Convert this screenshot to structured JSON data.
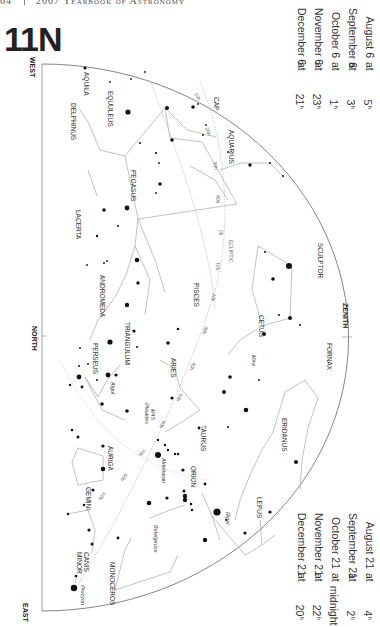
{
  "header": {
    "page_number": "64",
    "book_title": "2007 Yearbook of Astronomy"
  },
  "chart_id": "11N",
  "times_top": [
    {
      "date": "August 6",
      "time": "5",
      "unit": "h"
    },
    {
      "date": "September 6",
      "time": "3",
      "unit": "h"
    },
    {
      "date": "October 6",
      "time": "1",
      "unit": "h"
    },
    {
      "date": "November 6",
      "time": "23",
      "unit": "h"
    },
    {
      "date": "December 6",
      "time": "21",
      "unit": "h"
    }
  ],
  "times_bottom": [
    {
      "date": "August 21",
      "time": "4",
      "unit": "h"
    },
    {
      "date": "September 21",
      "time": "2",
      "unit": "h"
    },
    {
      "date": "October 21",
      "time": "midnight",
      "unit": ""
    },
    {
      "date": "November 21",
      "time": "22",
      "unit": "h"
    },
    {
      "date": "December 21",
      "time": "20",
      "unit": "h"
    }
  ],
  "connector": "at",
  "directions": {
    "west": "WEST",
    "north": "NORTH",
    "east": "EAST",
    "zenith": "ZENITH"
  },
  "constellations": {
    "aquila": "AQUILA",
    "delphinus": "DELPHINUS",
    "equuleus": "EQUULEUS",
    "cap": "CAP",
    "aquarius": "AQUARIUS",
    "pegasus": "PEGASUS",
    "lacerta": "LACERTA",
    "andromeda": "ANDROMEDA",
    "pisces": "PISCES",
    "sculptor": "SCULPTOR",
    "cetus": "CETUS",
    "triangulum": "TRIANGULUM",
    "perseus": "PERSEUS",
    "aries": "ARIES",
    "fornax": "FORNAX",
    "taurus": "TAURUS",
    "eridanus": "ERIDANUS",
    "auriga": "AURIGA",
    "orion": "ORION",
    "lepus": "LEPUS",
    "gemini": "GEMINI",
    "canis_minor_1": "CANIS",
    "canis_minor_2": "MINOR",
    "monoceros": "MONOCEROS"
  },
  "stars": {
    "mira": "Mira",
    "algol": "Algol",
    "pleiades": "Pleiades",
    "m45": "M45",
    "aldebaran": "Aldebaran",
    "rigel": "Rigel",
    "betelgeuse": "Betelgeuse",
    "procyon": "Procyon"
  },
  "ecliptic": {
    "label": "ECLIPTIC",
    "marks": [
      "10h",
      "20h",
      "30h",
      "40h",
      "0h",
      "10h",
      "20h",
      "30h",
      "40h",
      "50h",
      "60h",
      "70h",
      "80h",
      "90h"
    ]
  },
  "colors": {
    "line": "#999999",
    "star": "#111111",
    "text": "#333333",
    "horizon": "#777777"
  }
}
